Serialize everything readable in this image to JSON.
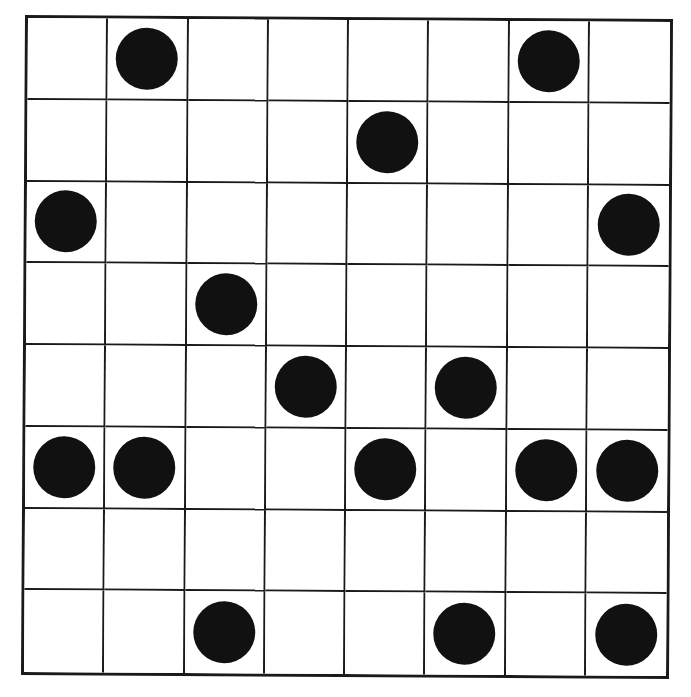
{
  "board": {
    "rows": 8,
    "cols": 8,
    "line_color": "#1a1a1a",
    "dot_color": "#111111",
    "background": "#ffffff",
    "cells": [
      [
        0,
        1,
        0,
        0,
        0,
        0,
        1,
        0
      ],
      [
        0,
        0,
        0,
        0,
        1,
        0,
        0,
        0
      ],
      [
        1,
        0,
        0,
        0,
        0,
        0,
        0,
        1
      ],
      [
        0,
        0,
        1,
        0,
        0,
        0,
        0,
        0
      ],
      [
        0,
        0,
        0,
        1,
        0,
        1,
        0,
        0
      ],
      [
        1,
        1,
        0,
        0,
        1,
        0,
        1,
        1
      ],
      [
        0,
        0,
        0,
        0,
        0,
        0,
        0,
        0
      ],
      [
        0,
        0,
        1,
        0,
        0,
        1,
        0,
        1
      ]
    ],
    "dot_count": 16
  }
}
